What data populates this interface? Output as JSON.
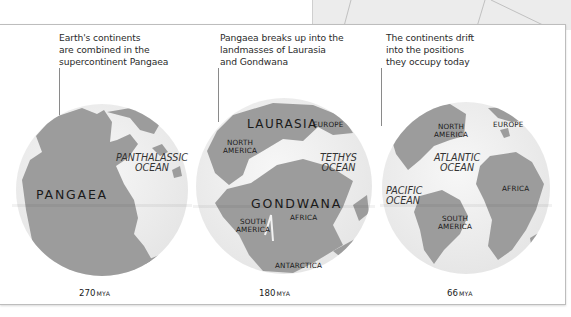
{
  "colors": {
    "land": "#9c9c9c",
    "globe_ocean": "#f2f2f2",
    "globe_shadow": "#e4e4e4",
    "panel_border": "#bdbdbd",
    "background_panel": "#ececec"
  },
  "stages": [
    {
      "caption": [
        "Earth's continents",
        "are combined in the",
        "supercontinent Pangaea"
      ],
      "era_value": "270",
      "era_unit": "MYA",
      "labels": {
        "landmass": "PANGAEA",
        "ocean": [
          "PANTHALASSIC",
          "OCEAN"
        ]
      }
    },
    {
      "caption": [
        "Pangaea breaks up into the",
        "landmasses of Laurasia",
        "and Gondwana"
      ],
      "era_value": "180",
      "era_unit": "MYA",
      "labels": {
        "laurasia": "LAURASIA",
        "europe": "EUROPE",
        "north_america": [
          "NORTH",
          "AMERICA"
        ],
        "ocean": [
          "TETHYS",
          "OCEAN"
        ],
        "gondwana": "GONDWANA",
        "south_america": [
          "SOUTH",
          "AMERICA"
        ],
        "africa": "AFRICA",
        "antarctica": "ANTARCTICA"
      }
    },
    {
      "caption": [
        "The continents drift",
        "into the positions",
        "they occupy today"
      ],
      "era_value": "66",
      "era_unit": "MYA",
      "labels": {
        "north_america": [
          "NORTH",
          "AMERICA"
        ],
        "europe": "EUROPE",
        "atlantic": [
          "ATLANTIC",
          "OCEAN"
        ],
        "pacific": [
          "PACIFIC",
          "OCEAN"
        ],
        "africa": "AFRICA",
        "south_america": [
          "SOUTH",
          "AMERICA"
        ]
      }
    }
  ]
}
